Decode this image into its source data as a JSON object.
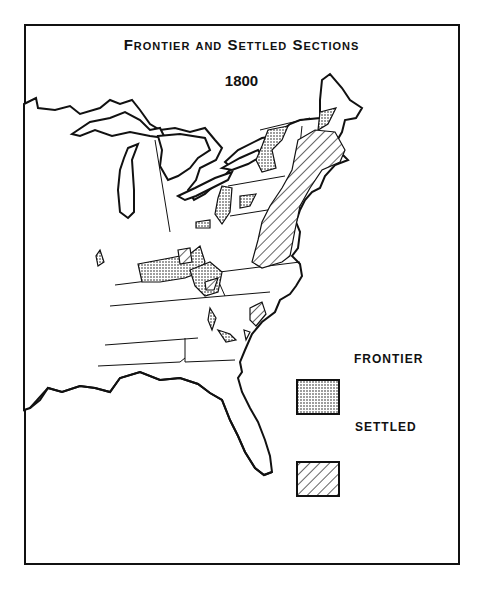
{
  "map": {
    "title": "Frontier and Settled Sections",
    "year": "1800",
    "region": "Eastern United States",
    "legend": [
      {
        "key": "frontier",
        "label": "FRONTIER",
        "pattern": "dotted stipple"
      },
      {
        "key": "settled",
        "label": "SETTLED",
        "pattern": "diagonal hatch"
      }
    ],
    "colors": {
      "ink": "#111111",
      "paper": "#ffffff"
    }
  }
}
